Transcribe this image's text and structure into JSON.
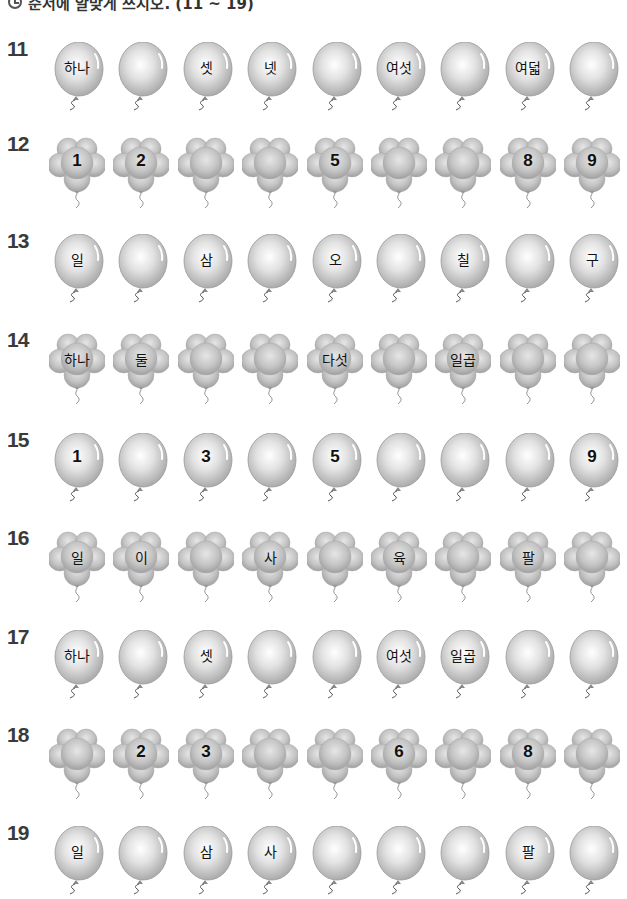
{
  "header": {
    "icon": "clock-icon",
    "instruction": "순서에 알맞게 쓰시오. (11 ~ 19)"
  },
  "rows": [
    {
      "number": "11",
      "shape": "round",
      "top": 42,
      "items": [
        "하나",
        "",
        "셋",
        "넷",
        "",
        "여섯",
        "",
        "여덟",
        ""
      ]
    },
    {
      "number": "12",
      "shape": "flower",
      "top": 137,
      "items": [
        "1",
        "2",
        "",
        "",
        "5",
        "",
        "",
        "8",
        "9"
      ]
    },
    {
      "number": "13",
      "shape": "round",
      "top": 234,
      "items": [
        "일",
        "",
        "삼",
        "",
        "오",
        "",
        "칠",
        "",
        "구"
      ]
    },
    {
      "number": "14",
      "shape": "flower",
      "top": 333,
      "items": [
        "하나",
        "둘",
        "",
        "",
        "다섯",
        "",
        "일곱",
        "",
        ""
      ]
    },
    {
      "number": "15",
      "shape": "round",
      "top": 433,
      "items": [
        "1",
        "",
        "3",
        "",
        "5",
        "",
        "",
        "",
        "9"
      ]
    },
    {
      "number": "16",
      "shape": "flower",
      "top": 531,
      "items": [
        "일",
        "이",
        "",
        "사",
        "",
        "육",
        "",
        "팔",
        ""
      ]
    },
    {
      "number": "17",
      "shape": "round",
      "top": 630,
      "items": [
        "하나",
        "",
        "셋",
        "",
        "",
        "여섯",
        "일곱",
        "",
        ""
      ]
    },
    {
      "number": "18",
      "shape": "flower",
      "top": 728,
      "items": [
        "",
        "2",
        "3",
        "",
        "",
        "6",
        "",
        "8",
        ""
      ]
    },
    {
      "number": "19",
      "shape": "round",
      "top": 826,
      "items": [
        "일",
        "",
        "삼",
        "사",
        "",
        "",
        "",
        "팔",
        ""
      ]
    }
  ],
  "colors": {
    "balloon_fill": "#c9c9c9",
    "balloon_highlight": "#f4f4f4",
    "balloon_edge": "#9a9a9a",
    "row_number": "#3a3a3a"
  }
}
